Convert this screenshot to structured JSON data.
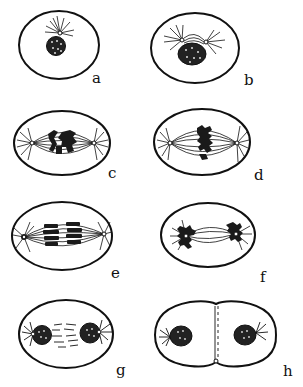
{
  "figure": {
    "ink_color": "#111111",
    "background": "#ffffff",
    "stages": [
      {
        "id": "a",
        "label": "a",
        "description": "prophase (early) - single aster beside nucleus"
      },
      {
        "id": "b",
        "label": "b",
        "description": "prophase - centrosomes separating over nucleus"
      },
      {
        "id": "c",
        "label": "c",
        "description": "prometaphase - spindle forming, chromosomes condensing"
      },
      {
        "id": "d",
        "label": "d",
        "description": "metaphase - chromosomes at equatorial plate"
      },
      {
        "id": "e",
        "label": "e",
        "description": "anaphase - chromosome groups separating"
      },
      {
        "id": "f",
        "label": "f",
        "description": "late anaphase - chromosomes at poles"
      },
      {
        "id": "g",
        "label": "g",
        "description": "telophase - daughter nuclei re-forming"
      },
      {
        "id": "h",
        "label": "h",
        "description": "cytokinesis - cell plate dividing daughter cells"
      }
    ]
  }
}
